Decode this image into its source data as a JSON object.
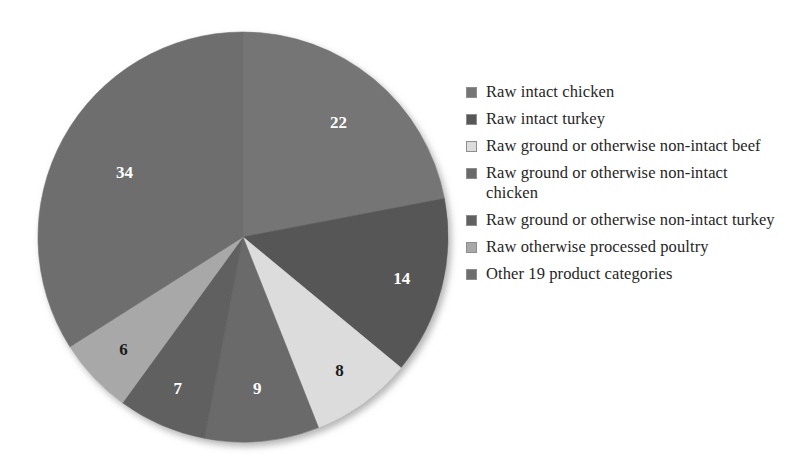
{
  "chart_data": {
    "type": "pie",
    "title": "",
    "subtitle": "",
    "xlabel": "",
    "ylabel": "",
    "grid": false,
    "legend_position": "right",
    "start_angle_deg": 0,
    "direction": "clockwise",
    "total": 100,
    "value_unit": "percent",
    "categories": [
      "Raw intact chicken",
      "Raw intact turkey",
      "Raw ground or otherwise non-intact beef",
      "Raw ground or otherwise non-intact chicken",
      "Raw ground or otherwise non-intact turkey",
      "Raw otherwise processed poultry",
      "Other 19 product categories"
    ],
    "values": [
      22,
      14,
      8,
      9,
      7,
      6,
      34
    ],
    "data_labels": [
      "22",
      "14",
      "8",
      "9",
      "7",
      "6",
      "34"
    ],
    "colors": [
      "#757575",
      "#575757",
      "#dcdcdc",
      "#6a6a6a",
      "#616161",
      "#a8a8a8",
      "#6e6e6e"
    ],
    "label_text_colors": [
      "#ffffff",
      "#ffffff",
      "#1a1a1a",
      "#ffffff",
      "#ffffff",
      "#1a1a1a",
      "#ffffff"
    ],
    "slices": [
      {
        "label": "Raw intact chicken",
        "value": 22,
        "data_label": "22",
        "color": "#757575",
        "label_color": "light"
      },
      {
        "label": "Raw intact turkey",
        "value": 14,
        "data_label": "14",
        "color": "#575757",
        "label_color": "light"
      },
      {
        "label": "Raw ground or otherwise non-intact beef",
        "value": 8,
        "data_label": "8",
        "color": "#dcdcdc",
        "label_color": "dark"
      },
      {
        "label": "Raw ground or otherwise non-intact chicken",
        "value": 9,
        "data_label": "9",
        "color": "#6a6a6a",
        "label_color": "light"
      },
      {
        "label": "Raw ground or otherwise non-intact turkey",
        "value": 7,
        "data_label": "7",
        "color": "#616161",
        "label_color": "light"
      },
      {
        "label": "Raw otherwise processed poultry",
        "value": 6,
        "data_label": "6",
        "color": "#a8a8a8",
        "label_color": "dark"
      },
      {
        "label": "Other 19 product categories",
        "value": 34,
        "data_label": "34",
        "color": "#6e6e6e",
        "label_color": "light"
      }
    ]
  },
  "legend": {
    "items": [
      {
        "label": "Raw intact chicken",
        "color": "#757575"
      },
      {
        "label": "Raw intact turkey",
        "color": "#575757"
      },
      {
        "label": "Raw ground or otherwise non-intact beef",
        "color": "#dcdcdc"
      },
      {
        "label": "Raw ground or otherwise non-intact chicken",
        "color": "#6a6a6a"
      },
      {
        "label": "Raw ground or otherwise non-intact turkey",
        "color": "#616161"
      },
      {
        "label": "Raw otherwise processed poultry",
        "color": "#a8a8a8"
      },
      {
        "label": "Other 19 product categories",
        "color": "#6e6e6e"
      }
    ]
  },
  "geometry": {
    "center_x": 243,
    "center_y": 237,
    "radius": 205
  }
}
